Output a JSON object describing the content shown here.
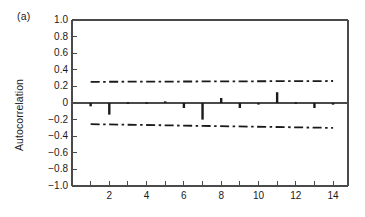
{
  "figure": {
    "panel_label": "(a)",
    "ylabel": "Autocorrelation",
    "xlabel": ""
  },
  "chart_data": {
    "type": "bar",
    "title": "",
    "subtitle": "",
    "panel": "(a)",
    "xlabel": "",
    "ylabel": "Autocorrelation",
    "xlim": [
      0,
      14.8
    ],
    "ylim": [
      -1.0,
      1.0
    ],
    "grid": false,
    "legend": null,
    "x_tick_labels": [
      "2",
      "4",
      "6",
      "8",
      "10",
      "12",
      "14"
    ],
    "x_ticks_major": [
      2,
      4,
      6,
      8,
      10,
      12,
      14
    ],
    "x_ticks_minor": [
      1,
      3,
      5,
      7,
      9,
      11,
      13
    ],
    "y_tick_labels": [
      "1.0",
      "0.8",
      "0.6",
      "0.4",
      "0.2",
      "0",
      "-0.2",
      "-0.4",
      "-0.6",
      "-0.8",
      "-1.0"
    ],
    "y_ticks": [
      1.0,
      0.8,
      0.6,
      0.4,
      0.2,
      0,
      -0.2,
      -0.4,
      -0.6,
      -0.8,
      -1.0
    ],
    "categories": [
      1,
      2,
      3,
      4,
      5,
      6,
      7,
      8,
      9,
      10,
      11,
      12,
      13,
      14
    ],
    "values": [
      -0.04,
      -0.14,
      0.01,
      0.01,
      0.02,
      -0.06,
      -0.2,
      0.06,
      -0.06,
      0.0,
      0.13,
      0.01,
      -0.06,
      -0.02
    ],
    "annotations": [
      {
        "name": "upper-confidence-band",
        "style": "dash-dot",
        "x": [
          1,
          14
        ],
        "y": [
          0.255,
          0.265
        ]
      },
      {
        "name": "lower-confidence-band",
        "style": "dash-dot",
        "x": [
          1,
          14
        ],
        "y": [
          -0.255,
          -0.3
        ]
      },
      {
        "name": "zero-line",
        "style": "solid",
        "x": [
          0,
          14.8
        ],
        "y": [
          0,
          0
        ]
      }
    ],
    "colors": {
      "bar": "#1a1a1a",
      "axis": "#4a4a4a",
      "confidence_band": "#1a1a1a",
      "background": "#ffffff"
    }
  }
}
